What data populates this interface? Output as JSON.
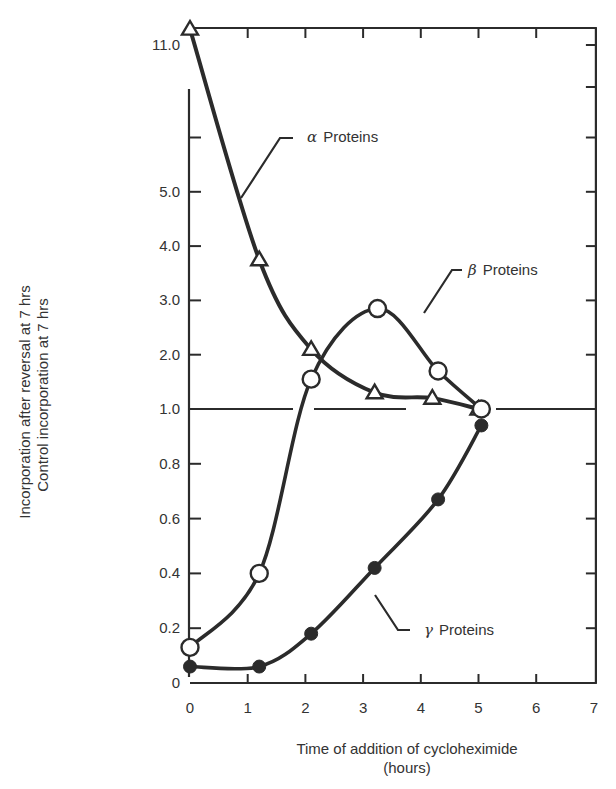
{
  "chart_data": {
    "type": "line",
    "title": "",
    "xlabel": "Time of addition of cycloheximide",
    "xlabel_unit": "(hours)",
    "ylabel_line1": "Incorporation after reversal at 7 hrs",
    "ylabel_line2": "Control incorporation at 7 hrs",
    "xlim": [
      0,
      7
    ],
    "ylim": [
      0,
      11.0
    ],
    "y_scale_note": "piecewise: 0-1.0 expanded scale, 1.0-6.0 compressed scale, broken axis up to 11.0",
    "x_ticks": [
      "0",
      "1",
      "2",
      "3",
      "4",
      "5",
      "6",
      "7"
    ],
    "y_ticks_lower": [
      "0",
      "0.2",
      "0.4",
      "0.6",
      "0.8",
      "1.0"
    ],
    "y_ticks_upper": [
      "2.0",
      "3.0",
      "4.0",
      "5.0"
    ],
    "y_tick_top": "11.0",
    "reference_line": 1.0,
    "grid": false,
    "series": [
      {
        "name": "α Proteins",
        "greek": "α",
        "label": "Proteins",
        "marker": "open-triangle",
        "x": [
          0,
          1.2,
          2.1,
          3.2,
          4.2,
          5.0
        ],
        "values": [
          11.0,
          3.75,
          2.1,
          1.3,
          1.2,
          1.0
        ]
      },
      {
        "name": "β Proteins",
        "greek": "β",
        "label": "Proteins",
        "marker": "open-circle",
        "x": [
          0,
          1.2,
          2.1,
          3.25,
          4.3,
          5.05
        ],
        "values": [
          0.13,
          0.4,
          1.55,
          2.85,
          1.7,
          1.0
        ]
      },
      {
        "name": "γ Proteins",
        "greek": "γ",
        "label": "Proteins",
        "marker": "filled-circle",
        "x": [
          0,
          1.2,
          2.1,
          3.2,
          4.3,
          5.05
        ],
        "values": [
          0.06,
          0.06,
          0.18,
          0.42,
          0.67,
          0.94
        ]
      }
    ]
  }
}
